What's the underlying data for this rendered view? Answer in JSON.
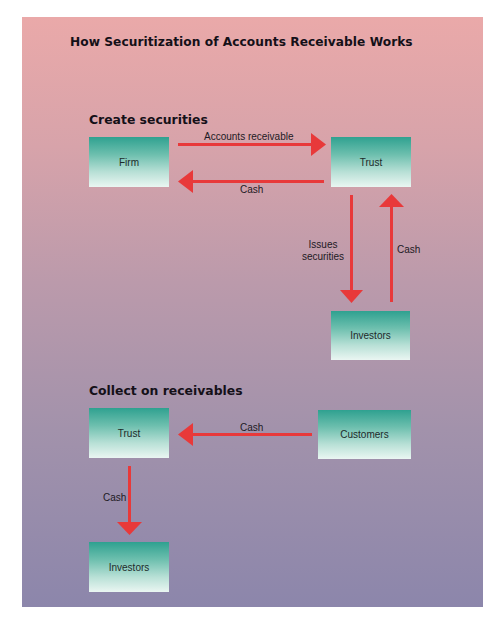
{
  "title": "How Securitization of Accounts Receivable Works",
  "sections": {
    "create": {
      "heading": "Create securities",
      "nodes": {
        "firm": "Firm",
        "trust": "Trust",
        "investors": "Investors"
      },
      "flows": {
        "firm_to_trust": "Accounts receivable",
        "trust_to_firm": "Cash",
        "trust_to_investors_line1": "Issues",
        "trust_to_investors_line2": "securities",
        "investors_to_trust": "Cash"
      }
    },
    "collect": {
      "heading": "Collect on receivables",
      "nodes": {
        "trust": "Trust",
        "customers": "Customers",
        "investors": "Investors"
      },
      "flows": {
        "customers_to_trust": "Cash",
        "trust_to_investors": "Cash"
      }
    }
  },
  "colors": {
    "arrow": "#e8393a",
    "box_top": "#2fa190",
    "box_bottom": "#eaf6f2",
    "background_top": "#eaa9a9",
    "background_bottom": "#8c86ab"
  }
}
